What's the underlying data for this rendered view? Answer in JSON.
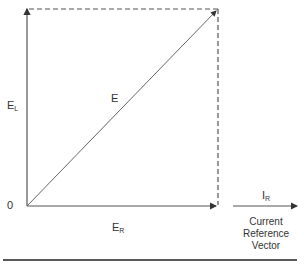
{
  "diagram": {
    "type": "phasor-vector-diagram",
    "vectors": {
      "resultant": {
        "label": "E"
      },
      "vertical": {
        "label_main": "E",
        "label_sub": "L"
      },
      "horizontal": {
        "label_main": "E",
        "label_sub": "R"
      },
      "reference": {
        "label_main": "I",
        "label_sub": "R"
      }
    },
    "origin_label": "0",
    "reference_caption": [
      "Current",
      "Reference",
      "Vector"
    ],
    "colors": {
      "line": "#555555",
      "text": "#333333",
      "rule": "#222222"
    }
  }
}
